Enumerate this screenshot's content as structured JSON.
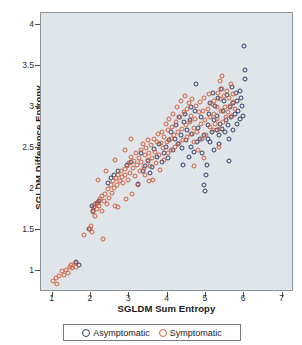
{
  "chart_data": {
    "type": "scatter",
    "title": "",
    "xlabel": "SGLDM Sum Entropy",
    "ylabel": "SGLDM Difference Entropy",
    "xlim": [
      0.7,
      7.3
    ],
    "ylim": [
      0.75,
      4.15
    ],
    "xticks": [
      "1",
      "2",
      "3",
      "4",
      "5",
      "6",
      "7"
    ],
    "xtick_values": [
      1,
      2,
      3,
      4,
      5,
      6,
      7
    ],
    "yticks": [
      "4",
      "3.5",
      "3",
      "2.5",
      "2",
      "1.5",
      "1"
    ],
    "ytick_values": [
      4,
      3.5,
      3,
      2.5,
      2,
      1.5,
      1
    ],
    "grid": false,
    "legend_position": "below-outside",
    "plot_background": "#dfe5e8",
    "figure_background": "#ffffff",
    "series": [
      {
        "name": "Asymptomatic",
        "marker": "open-circle",
        "color": "#2e3d66",
        "points": [
          [
            1.62,
            1.12
          ],
          [
            1.7,
            1.08
          ],
          [
            1.95,
            1.52
          ],
          [
            2.02,
            1.8
          ],
          [
            2.05,
            1.74
          ],
          [
            2.08,
            1.78
          ],
          [
            2.15,
            1.83
          ],
          [
            2.22,
            1.86
          ],
          [
            2.45,
            2.08
          ],
          [
            2.52,
            2.14
          ],
          [
            2.6,
            2.18
          ],
          [
            2.72,
            2.22
          ],
          [
            2.95,
            2.3
          ],
          [
            3.05,
            2.33
          ],
          [
            3.22,
            2.07
          ],
          [
            3.35,
            2.22
          ],
          [
            3.42,
            2.28
          ],
          [
            3.48,
            2.35
          ],
          [
            3.55,
            2.2
          ],
          [
            3.6,
            2.27
          ],
          [
            3.65,
            2.49
          ],
          [
            3.72,
            2.4
          ],
          [
            3.78,
            2.55
          ],
          [
            3.85,
            2.33
          ],
          [
            3.9,
            2.45
          ],
          [
            3.95,
            2.52
          ],
          [
            4.0,
            2.38
          ],
          [
            4.05,
            2.6
          ],
          [
            4.1,
            2.7
          ],
          [
            4.15,
            2.48
          ],
          [
            4.2,
            2.62
          ],
          [
            4.22,
            2.78
          ],
          [
            4.28,
            2.55
          ],
          [
            4.3,
            2.88
          ],
          [
            4.35,
            2.66
          ],
          [
            4.38,
            2.5
          ],
          [
            4.42,
            2.82
          ],
          [
            4.45,
            2.92
          ],
          [
            4.48,
            2.6
          ],
          [
            4.52,
            2.72
          ],
          [
            4.55,
            2.4
          ],
          [
            4.58,
            2.85
          ],
          [
            4.6,
            3.0
          ],
          [
            4.62,
            2.52
          ],
          [
            4.65,
            2.68
          ],
          [
            4.68,
            2.46
          ],
          [
            4.72,
            2.95
          ],
          [
            4.75,
            3.28
          ],
          [
            4.78,
            2.58
          ],
          [
            4.8,
            2.75
          ],
          [
            4.85,
            2.62
          ],
          [
            4.88,
            2.88
          ],
          [
            4.9,
            2.44
          ],
          [
            4.95,
            2.66
          ],
          [
            4.98,
            1.98
          ],
          [
            5.0,
            2.18
          ],
          [
            5.02,
            2.3
          ],
          [
            5.05,
            2.78
          ],
          [
            5.08,
            2.92
          ],
          [
            5.1,
            3.05
          ],
          [
            5.12,
            2.58
          ],
          [
            5.15,
            2.7
          ],
          [
            5.18,
            3.18
          ],
          [
            5.2,
            2.85
          ],
          [
            5.22,
            2.48
          ],
          [
            5.25,
            3.02
          ],
          [
            5.28,
            2.72
          ],
          [
            5.3,
            2.9
          ],
          [
            5.32,
            3.12
          ],
          [
            5.35,
            2.66
          ],
          [
            5.38,
            2.8
          ],
          [
            5.4,
            3.22
          ],
          [
            5.42,
            2.74
          ],
          [
            5.45,
            2.95
          ],
          [
            5.48,
            3.08
          ],
          [
            5.5,
            2.7
          ],
          [
            5.52,
            2.85
          ],
          [
            5.55,
            3.15
          ],
          [
            5.58,
            2.78
          ],
          [
            5.6,
            2.62
          ],
          [
            5.62,
            3.0
          ],
          [
            5.65,
            2.88
          ],
          [
            5.68,
            3.25
          ],
          [
            5.7,
            2.72
          ],
          [
            5.72,
            3.05
          ],
          [
            5.75,
            2.92
          ],
          [
            5.78,
            3.18
          ],
          [
            5.8,
            2.8
          ],
          [
            5.82,
            3.08
          ],
          [
            5.85,
            2.96
          ],
          [
            5.88,
            3.2
          ],
          [
            5.9,
            2.86
          ],
          [
            5.92,
            3.12
          ],
          [
            5.95,
            3.02
          ],
          [
            5.98,
            2.9
          ],
          [
            6.0,
            3.75
          ],
          [
            6.02,
            3.45
          ],
          [
            6.02,
            3.35
          ],
          [
            5.35,
            2.55
          ],
          [
            5.6,
            2.35
          ],
          [
            5.05,
            2.62
          ],
          [
            4.4,
            2.3
          ],
          [
            4.95,
            2.05
          ],
          [
            3.3,
            2.45
          ]
        ]
      },
      {
        "name": "Symptomatic",
        "marker": "open-circle",
        "color": "#d4603f",
        "points": [
          [
            1.02,
            0.88
          ],
          [
            1.08,
            0.92
          ],
          [
            1.12,
            0.85
          ],
          [
            1.18,
            0.95
          ],
          [
            1.25,
            1.0
          ],
          [
            1.3,
            0.96
          ],
          [
            1.35,
            1.02
          ],
          [
            1.4,
            0.98
          ],
          [
            1.45,
            1.05
          ],
          [
            1.48,
            1.08
          ],
          [
            1.52,
            1.04
          ],
          [
            1.58,
            1.1
          ],
          [
            1.62,
            1.06
          ],
          [
            1.98,
            1.52
          ],
          [
            2.0,
            1.55
          ],
          [
            2.02,
            1.48
          ],
          [
            2.05,
            1.72
          ],
          [
            2.08,
            1.78
          ],
          [
            2.1,
            1.82
          ],
          [
            2.12,
            1.68
          ],
          [
            2.15,
            1.76
          ],
          [
            2.18,
            1.84
          ],
          [
            2.2,
            1.8
          ],
          [
            2.25,
            1.88
          ],
          [
            2.28,
            1.74
          ],
          [
            2.3,
            1.92
          ],
          [
            2.32,
            1.4
          ],
          [
            2.35,
            1.86
          ],
          [
            2.38,
            1.95
          ],
          [
            2.42,
            1.82
          ],
          [
            2.45,
            2.0
          ],
          [
            2.48,
            1.9
          ],
          [
            2.52,
            2.05
          ],
          [
            2.55,
            1.96
          ],
          [
            2.58,
            2.1
          ],
          [
            2.6,
            2.02
          ],
          [
            2.62,
            1.8
          ],
          [
            2.65,
            2.14
          ],
          [
            2.68,
            2.06
          ],
          [
            2.7,
            2.18
          ],
          [
            2.72,
            1.78
          ],
          [
            2.75,
            2.1
          ],
          [
            2.78,
            2.22
          ],
          [
            2.8,
            2.15
          ],
          [
            2.85,
            2.08
          ],
          [
            2.88,
            2.25
          ],
          [
            2.9,
            2.18
          ],
          [
            2.92,
            1.88
          ],
          [
            2.95,
            2.28
          ],
          [
            2.98,
            2.12
          ],
          [
            3.0,
            2.32
          ],
          [
            3.02,
            2.2
          ],
          [
            3.05,
            2.4
          ],
          [
            3.08,
            1.95
          ],
          [
            3.1,
            2.26
          ],
          [
            3.12,
            2.35
          ],
          [
            3.15,
            2.16
          ],
          [
            3.18,
            2.44
          ],
          [
            3.2,
            2.3
          ],
          [
            3.22,
            2.05
          ],
          [
            3.25,
            2.38
          ],
          [
            3.28,
            2.22
          ],
          [
            3.3,
            2.48
          ],
          [
            3.32,
            2.34
          ],
          [
            3.35,
            2.55
          ],
          [
            3.38,
            2.26
          ],
          [
            3.4,
            2.42
          ],
          [
            3.42,
            2.18
          ],
          [
            3.45,
            2.5
          ],
          [
            3.48,
            2.36
          ],
          [
            3.5,
            2.6
          ],
          [
            3.52,
            2.44
          ],
          [
            3.55,
            2.28
          ],
          [
            3.58,
            2.54
          ],
          [
            3.6,
            2.38
          ],
          [
            3.62,
            2.12
          ],
          [
            3.65,
            2.62
          ],
          [
            3.68,
            2.46
          ],
          [
            3.7,
            2.32
          ],
          [
            3.72,
            2.58
          ],
          [
            3.75,
            2.68
          ],
          [
            3.78,
            2.42
          ],
          [
            3.8,
            2.24
          ],
          [
            3.82,
            2.56
          ],
          [
            3.85,
            2.7
          ],
          [
            3.88,
            2.5
          ],
          [
            3.9,
            2.36
          ],
          [
            3.92,
            2.64
          ],
          [
            3.95,
            2.8
          ],
          [
            3.98,
            2.58
          ],
          [
            4.0,
            2.44
          ],
          [
            4.02,
            2.72
          ],
          [
            4.05,
            2.86
          ],
          [
            4.08,
            2.62
          ],
          [
            4.1,
            2.48
          ],
          [
            4.12,
            2.76
          ],
          [
            4.15,
            2.92
          ],
          [
            4.18,
            2.66
          ],
          [
            4.2,
            2.52
          ],
          [
            4.22,
            2.82
          ],
          [
            4.25,
            3.0
          ],
          [
            4.28,
            2.7
          ],
          [
            4.3,
            2.56
          ],
          [
            4.32,
            2.88
          ],
          [
            4.35,
            3.08
          ],
          [
            4.38,
            2.74
          ],
          [
            4.4,
            2.6
          ],
          [
            4.42,
            2.94
          ],
          [
            4.45,
            3.14
          ],
          [
            4.48,
            2.78
          ],
          [
            4.5,
            2.64
          ],
          [
            4.52,
            2.98
          ],
          [
            4.55,
            3.05
          ],
          [
            4.58,
            2.82
          ],
          [
            4.6,
            2.68
          ],
          [
            4.62,
            2.9
          ],
          [
            4.65,
            3.1
          ],
          [
            4.68,
            2.75
          ],
          [
            4.7,
            2.58
          ],
          [
            4.72,
            2.86
          ],
          [
            4.75,
            3.02
          ],
          [
            4.78,
            2.7
          ],
          [
            4.8,
            2.48
          ],
          [
            4.82,
            2.94
          ],
          [
            4.85,
            3.06
          ],
          [
            4.88,
            2.8
          ],
          [
            4.9,
            2.62
          ],
          [
            4.92,
            2.96
          ],
          [
            4.95,
            3.12
          ],
          [
            4.98,
            2.84
          ],
          [
            5.0,
            2.66
          ],
          [
            5.05,
            2.98
          ],
          [
            5.08,
            3.16
          ],
          [
            5.1,
            2.76
          ],
          [
            5.12,
            2.88
          ],
          [
            5.15,
            3.04
          ],
          [
            5.18,
            2.72
          ],
          [
            5.2,
            2.92
          ],
          [
            5.22,
            3.08
          ],
          [
            5.25,
            2.8
          ],
          [
            5.28,
            3.0
          ],
          [
            5.3,
            2.86
          ],
          [
            5.32,
            3.18
          ],
          [
            5.35,
            2.74
          ],
          [
            5.38,
            3.1
          ],
          [
            5.4,
            2.96
          ],
          [
            5.42,
            3.22
          ],
          [
            5.45,
            2.82
          ],
          [
            5.48,
            3.14
          ],
          [
            5.5,
            3.0
          ],
          [
            5.52,
            2.88
          ],
          [
            5.55,
            3.2
          ],
          [
            5.58,
            2.94
          ],
          [
            5.6,
            3.12
          ],
          [
            5.62,
            3.02
          ],
          [
            5.65,
            3.28
          ],
          [
            5.68,
            2.9
          ],
          [
            5.7,
            3.16
          ],
          [
            5.72,
            3.06
          ],
          [
            5.75,
            2.98
          ],
          [
            5.38,
            3.32
          ],
          [
            5.42,
            3.38
          ],
          [
            5.35,
            2.52
          ],
          [
            4.95,
            2.38
          ],
          [
            4.68,
            2.28
          ],
          [
            3.52,
            2.1
          ],
          [
            3.05,
            2.62
          ],
          [
            2.88,
            2.48
          ],
          [
            2.62,
            2.36
          ],
          [
            2.4,
            2.22
          ],
          [
            2.18,
            2.12
          ],
          [
            1.82,
            1.45
          ]
        ]
      }
    ]
  },
  "legend": {
    "items": [
      {
        "label": "Asymptomatic",
        "color": "#2e3d66"
      },
      {
        "label": "Symptomatic",
        "color": "#d4603f"
      }
    ]
  }
}
